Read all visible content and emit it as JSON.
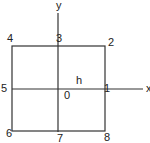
{
  "diagram": {
    "axes": {
      "x_label": "x",
      "y_label": "y"
    },
    "spacing_label": "h",
    "nodes": [
      {
        "id": "0",
        "label": "0",
        "position": "center"
      },
      {
        "id": "1",
        "label": "1",
        "position": "right-middle"
      },
      {
        "id": "2",
        "label": "2",
        "position": "top-right"
      },
      {
        "id": "3",
        "label": "3",
        "position": "top-middle"
      },
      {
        "id": "4",
        "label": "4",
        "position": "top-left"
      },
      {
        "id": "5",
        "label": "5",
        "position": "left-middle"
      },
      {
        "id": "6",
        "label": "6",
        "position": "bottom-left"
      },
      {
        "id": "7",
        "label": "7",
        "position": "bottom-middle"
      },
      {
        "id": "8",
        "label": "8",
        "position": "bottom-right"
      }
    ],
    "colors": {
      "line": "#333333",
      "text": "#222222",
      "background": "#ffffff"
    }
  }
}
